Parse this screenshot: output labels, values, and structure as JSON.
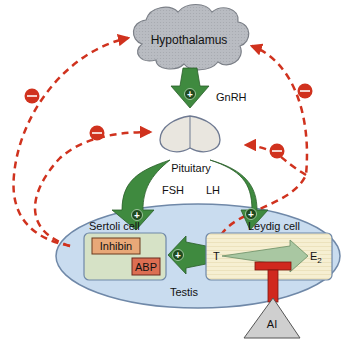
{
  "diagram": {
    "nodes": {
      "hypothalamus": "Hypothalamus",
      "pituitary": "Pituitary",
      "testis": "Testis",
      "sertoli_cell": "Sertoli cell",
      "leydig_cell": "Leydig cell",
      "inhibin": "Inhibin",
      "abp": "ABP",
      "testosterone": "T",
      "estradiol": "E",
      "estradiol_sub": "2",
      "aromatase_inhibitor": "AI"
    },
    "hormones": {
      "gnrh": "GnRH",
      "fsh": "FSH",
      "lh": "LH"
    },
    "symbols": {
      "stimulate": "+",
      "inhibit": "−"
    },
    "colors": {
      "feedback_red": "#d0321e",
      "arrow_green": "#3f8a3f",
      "cloud_gray": "#b9bcc2",
      "pituitary_fill": "#e9e6df",
      "testis_fill": "#c9dcef",
      "sertoli_fill": "#d6e2c6",
      "leydig_fill": "#f6efd2",
      "inhibin_fill": "#e8a878",
      "abp_fill": "#dc6e52",
      "blocker_red": "#d0281e",
      "ai_gray": "#cfcfcf"
    }
  }
}
